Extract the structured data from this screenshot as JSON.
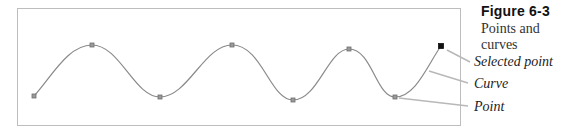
{
  "figure": {
    "title": "Figure 6-3",
    "subtitle": "Points and curves"
  },
  "callouts": [
    {
      "label": "Selected point",
      "target": "selected-point"
    },
    {
      "label": "Curve",
      "target": "curve"
    },
    {
      "label": "Point",
      "target": "point"
    }
  ],
  "colors": {
    "frame": "#bdbdbd",
    "curve": "#8a8a8a",
    "point_fill": "#9a9a9a",
    "selected_point": "#111111",
    "leader": "#b8b8b8"
  },
  "diagram": {
    "points": [
      {
        "x": 34,
        "y": 96,
        "selected": false
      },
      {
        "x": 92,
        "y": 45,
        "selected": false
      },
      {
        "x": 160,
        "y": 97,
        "selected": false
      },
      {
        "x": 232,
        "y": 45,
        "selected": false
      },
      {
        "x": 293,
        "y": 100,
        "selected": false
      },
      {
        "x": 349,
        "y": 49,
        "selected": false
      },
      {
        "x": 395,
        "y": 97,
        "selected": false
      },
      {
        "x": 441,
        "y": 46,
        "selected": true
      }
    ]
  }
}
